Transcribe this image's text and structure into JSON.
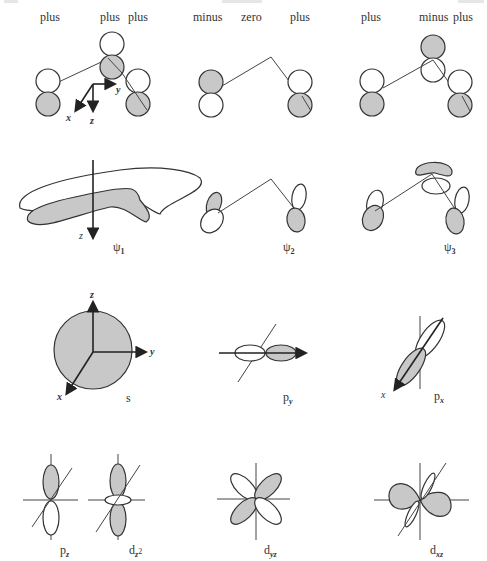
{
  "diagram": {
    "type": "molecular-orbital-illustration",
    "row1": {
      "panel1": {
        "labels": [
          "plus",
          "plus",
          "plus"
        ],
        "axes": [
          "x",
          "y",
          "z"
        ]
      },
      "panel2": {
        "labels": [
          "minus",
          "zero",
          "plus"
        ]
      },
      "panel3": {
        "labels": [
          "plus",
          "minus",
          "plus"
        ]
      }
    },
    "row2": {
      "psi1": {
        "label": "ψ",
        "sub": "1",
        "axis": "z"
      },
      "psi2": {
        "label": "ψ",
        "sub": "2"
      },
      "psi3": {
        "label": "ψ",
        "sub": "3"
      }
    },
    "row3": {
      "s": {
        "label": "s",
        "axes": [
          "z",
          "y",
          "x"
        ]
      },
      "py": {
        "label": "p",
        "sub": "y"
      },
      "px": {
        "label": "p",
        "sub": "x",
        "axis": "x"
      }
    },
    "row4": {
      "pz": {
        "label": "p",
        "sub": "z"
      },
      "dz2": {
        "label": "d",
        "sub": "z",
        "sup": "2"
      },
      "dyz": {
        "label": "d",
        "sub": "yz"
      },
      "dxz": {
        "label": "d",
        "sub": "xz"
      }
    },
    "colors": {
      "shaded": "#c8c8c8",
      "stroke": "#333333",
      "background": "#ffffff"
    }
  }
}
